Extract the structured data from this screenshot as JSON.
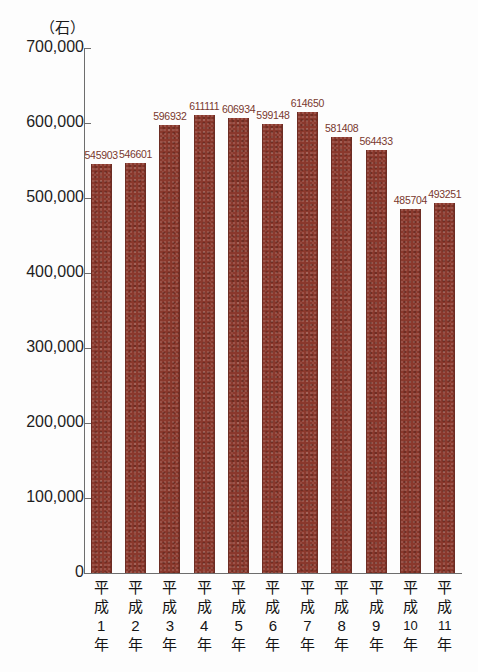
{
  "chart_data": {
    "type": "bar",
    "title": "",
    "subtitle": "",
    "xlabel": "",
    "ylabel": "",
    "unit_label": "（石）",
    "categories": [
      "平成1年",
      "平成2年",
      "平成3年",
      "平成4年",
      "平成5年",
      "平成6年",
      "平成7年",
      "平成8年",
      "平成9年",
      "平成10年",
      "平成11年"
    ],
    "category_chars": [
      [
        "平",
        "成",
        "1",
        "年"
      ],
      [
        "平",
        "成",
        "2",
        "年"
      ],
      [
        "平",
        "成",
        "3",
        "年"
      ],
      [
        "平",
        "成",
        "4",
        "年"
      ],
      [
        "平",
        "成",
        "5",
        "年"
      ],
      [
        "平",
        "成",
        "6",
        "年"
      ],
      [
        "平",
        "成",
        "7",
        "年"
      ],
      [
        "平",
        "成",
        "8",
        "年"
      ],
      [
        "平",
        "成",
        "9",
        "年"
      ],
      [
        "平",
        "成",
        "10",
        "年"
      ],
      [
        "平",
        "成",
        "11",
        "年"
      ]
    ],
    "values": [
      545903,
      546601,
      596932,
      611111,
      606934,
      599148,
      614650,
      581408,
      564433,
      485704,
      493251
    ],
    "value_labels": [
      "545903",
      "546601",
      "596932",
      "611111",
      "606934",
      "599148",
      "614650",
      "581408",
      "564433",
      "485704",
      "493251"
    ],
    "ylim": [
      0,
      700000
    ],
    "ytick_values": [
      700000,
      600000,
      500000,
      400000,
      300000,
      200000,
      100000,
      0
    ],
    "ytick_labels": [
      "700,000",
      "600,000",
      "500,000",
      "400,000",
      "300,000",
      "200,000",
      "100,000",
      "0"
    ],
    "grid": false,
    "legend": false,
    "legend_position": "none",
    "bar_color": "#8a382c",
    "value_label_color": "#79382e",
    "axis_color": "#6d6d6d",
    "background_color": "#fdfdfd"
  }
}
